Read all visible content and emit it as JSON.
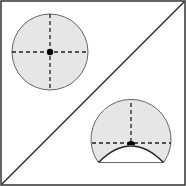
{
  "diagram": {
    "colors": {
      "fill": "#e6e6e6",
      "stroke": "#555555",
      "dash": "#222222",
      "dot": "#000000",
      "frame": "#333333"
    },
    "shapes": [
      {
        "name": "full-circle",
        "cx": 50,
        "cy": 52,
        "r": 38
      },
      {
        "name": "truncated-circle",
        "cx": 131,
        "cy": 143,
        "r": 40,
        "chord_y": 162
      }
    ]
  }
}
